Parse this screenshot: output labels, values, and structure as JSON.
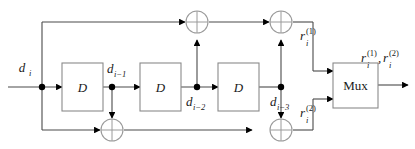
{
  "diagram": {
    "type": "block-diagram",
    "input": {
      "name": "input-signal",
      "label_base": "d",
      "label_sub": "i",
      "label_full": "d_i"
    },
    "delay_blocks": [
      {
        "id": "D1",
        "label": "D",
        "output_base": "d",
        "output_sub": "i−1",
        "output_full": "d_{i-1}"
      },
      {
        "id": "D2",
        "label": "D",
        "output_base": "d",
        "output_sub": "i−2",
        "output_full": "d_{i-2}"
      },
      {
        "id": "D3",
        "label": "D",
        "output_base": "d",
        "output_sub": "i−3",
        "output_full": "d_{i-3}"
      }
    ],
    "adders": [
      {
        "id": "xor-top-1",
        "symbol": "⊕",
        "rail": "top"
      },
      {
        "id": "xor-top-2",
        "symbol": "⊕",
        "rail": "top"
      },
      {
        "id": "xor-bottom-1",
        "symbol": "⊕",
        "rail": "bottom"
      },
      {
        "id": "xor-bottom-2",
        "symbol": "⊕",
        "rail": "bottom"
      }
    ],
    "mux": {
      "label": "Mux",
      "inputs": 2,
      "outputs": 1
    },
    "outputs": [
      {
        "id": "r1",
        "base": "r",
        "sub": "i",
        "sup": "(1)",
        "full": "r_i^{(1)}"
      },
      {
        "id": "r2",
        "base": "r",
        "sub": "i",
        "sup": "(2)",
        "full": "r_i^{(2)}"
      },
      {
        "id": "rmux",
        "base": "r",
        "sub": "i",
        "sup": "(1)",
        "base2": "r",
        "sub2": "i",
        "sup2": "(2)",
        "sep": ",",
        "full": "r_i^{(1)},r_i^{(2)}"
      }
    ],
    "colors": {
      "wire": "#4a4a4a",
      "box_stroke": "#8a8a8a",
      "gate_stroke": "#9a9a9a",
      "text": "#1a1a1a",
      "node": "#000000",
      "background": "#ffffff"
    }
  }
}
